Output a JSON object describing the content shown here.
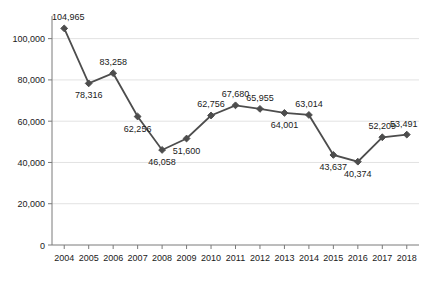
{
  "chart_data": {
    "type": "line",
    "title": "",
    "subtitle": "",
    "xlabel": "",
    "ylabel": "",
    "grid": true,
    "legend": null,
    "ylim": [
      0,
      110000
    ],
    "yticks": [
      0,
      20000,
      40000,
      60000,
      80000,
      100000
    ],
    "ytick_labels": [
      "0",
      "20,000",
      "40,000",
      "60,000",
      "80,000",
      "100,000"
    ],
    "categories": [
      "2004",
      "2005",
      "2006",
      "2007",
      "2008",
      "2009",
      "2010",
      "2011",
      "2012",
      "2013",
      "2014",
      "2015",
      "2016",
      "2017",
      "2018"
    ],
    "values": [
      104965,
      78316,
      83258,
      62256,
      46058,
      51600,
      62756,
      67680,
      65955,
      64001,
      63014,
      43637,
      40374,
      52209,
      53491
    ],
    "point_labels": [
      "104,965",
      "78,316",
      "83,258",
      "62,256",
      "46,058",
      "51,600",
      "62,756",
      "67,680",
      "65,955",
      "64,001",
      "63,014",
      "43,637",
      "40,374",
      "52,209",
      "53,491"
    ],
    "label_positions": [
      "above",
      "below",
      "above",
      "below",
      "below",
      "below",
      "above",
      "above",
      "above",
      "below",
      "above",
      "below",
      "below",
      "above",
      "above"
    ],
    "colors": {
      "line": "#4d4d4d",
      "marker": "#4d4d4d",
      "axis": "#7a7a7a",
      "grid": "#e2e2e2",
      "text": "#1a1a1a",
      "background": "#ffffff"
    }
  }
}
